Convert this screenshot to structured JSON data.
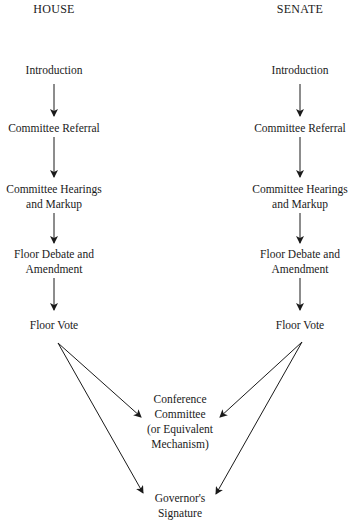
{
  "diagram": {
    "type": "flowchart",
    "house": {
      "header": "HOUSE",
      "steps": [
        "Introduction",
        "Committee Referral",
        "Committee Hearings\nand Markup",
        "Floor Debate and\nAmendment",
        "Floor Vote"
      ]
    },
    "senate": {
      "header": "SENATE",
      "steps": [
        "Introduction",
        "Committee Referral",
        "Committee Hearings\nand Markup",
        "Floor Debate and\nAmendment",
        "Floor Vote"
      ]
    },
    "convergence": {
      "conference": "Conference\nCommittee\n(or Equivalent\nMechanism)",
      "signature": "Governor's\nSignature"
    },
    "edges": [
      [
        "house.Introduction",
        "house.Committee Referral"
      ],
      [
        "house.Committee Referral",
        "house.Committee Hearings and Markup"
      ],
      [
        "house.Committee Hearings and Markup",
        "house.Floor Debate and Amendment"
      ],
      [
        "house.Floor Debate and Amendment",
        "house.Floor Vote"
      ],
      [
        "house.Floor Vote",
        "Conference Committee"
      ],
      [
        "house.Floor Vote",
        "Governor's Signature"
      ],
      [
        "senate.Introduction",
        "senate.Committee Referral"
      ],
      [
        "senate.Committee Referral",
        "senate.Committee Hearings and Markup"
      ],
      [
        "senate.Committee Hearings and Markup",
        "senate.Floor Debate and Amendment"
      ],
      [
        "senate.Floor Debate and Amendment",
        "senate.Floor Vote"
      ],
      [
        "senate.Floor Vote",
        "Conference Committee"
      ],
      [
        "senate.Floor Vote",
        "Governor's Signature"
      ]
    ]
  }
}
